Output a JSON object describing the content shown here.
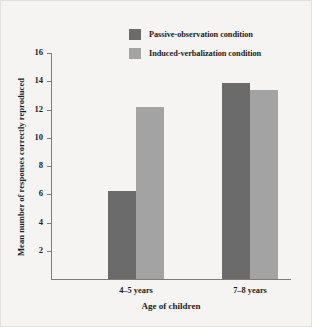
{
  "chart_data": {
    "type": "bar",
    "title": "",
    "xlabel": "Age of children",
    "ylabel": "Mean number of responses correctly reproduced",
    "categories": [
      "4–5 years",
      "7–8 years"
    ],
    "series": [
      {
        "name": "Passive-observation condition",
        "color": "#6b6b6b",
        "values": [
          6.2,
          13.9
        ]
      },
      {
        "name": "Induced-verbalization condition",
        "color": "#a3a3a3",
        "values": [
          12.2,
          13.4
        ]
      }
    ],
    "ylim": [
      0,
      16
    ],
    "yticks": [
      2,
      4,
      6,
      8,
      10,
      12,
      14,
      16
    ],
    "ytick_labels": [
      "2",
      "4",
      "6",
      "8",
      "10",
      "12",
      "14",
      "16"
    ],
    "grid": false,
    "legend_position": "top-right",
    "background_color": "#f5f4f2",
    "axis_color": "#7c7c7c"
  }
}
